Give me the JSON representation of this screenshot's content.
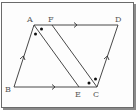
{
  "diagram": {
    "points": {
      "A": {
        "label": "A",
        "x": 34,
        "y": 25
      },
      "F": {
        "label": "F",
        "x": 52,
        "y": 25
      },
      "D": {
        "label": "D",
        "x": 118,
        "y": 25
      },
      "B": {
        "label": "B",
        "x": 14,
        "y": 87
      },
      "E": {
        "label": "E",
        "x": 79,
        "y": 87
      },
      "C": {
        "label": "C",
        "x": 97,
        "y": 87
      }
    },
    "segments": [
      "AD",
      "BC",
      "AB",
      "DC",
      "AE",
      "FC"
    ],
    "parallel_marks": [
      "AD",
      "BC",
      "AB",
      "DC"
    ],
    "angle_marks": [
      "A (double dot)",
      "C (double dot)"
    ],
    "colors": {
      "line": "#333333",
      "label": "#555555",
      "frame": "#6b6b6b"
    }
  }
}
